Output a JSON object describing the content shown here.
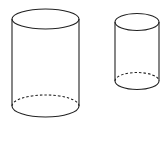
{
  "diagram": {
    "title": "",
    "stroke_color": "#222222",
    "background": "#ffffff",
    "shapes": [
      {
        "name": "large-cylinder",
        "cx": 45.5,
        "rx": 33.5,
        "top_cy": 19,
        "top_ry": 10,
        "bottom_cy": 106,
        "bottom_ry": 11
      },
      {
        "name": "small-cylinder",
        "cx": 137,
        "rx": 22,
        "top_cy": 22,
        "top_ry": 8.5,
        "bottom_cy": 81,
        "bottom_ry": 8.5
      }
    ]
  }
}
